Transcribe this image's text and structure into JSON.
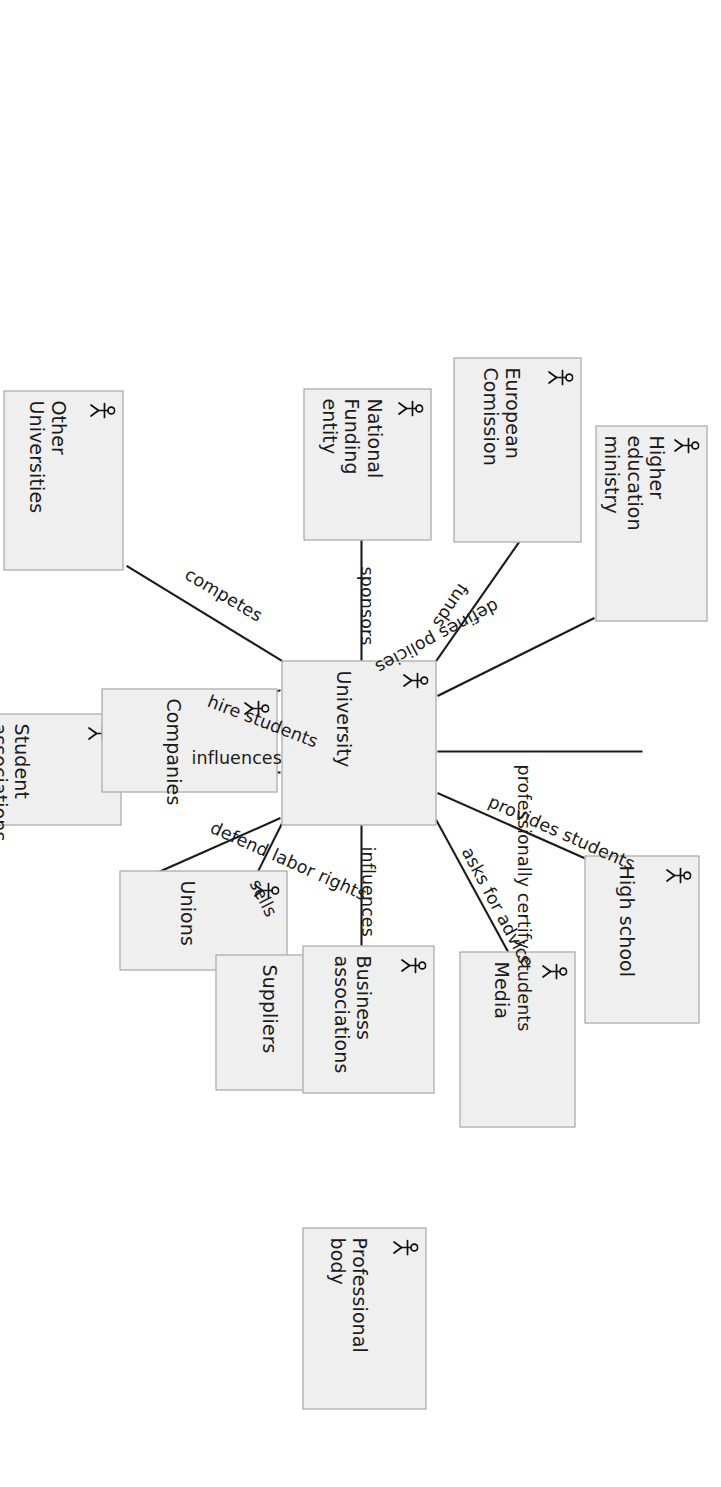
{
  "diagram": {
    "type": "actor-relationship-diagram",
    "orientation_deg": 90,
    "style": {
      "node_fill": "#efefef",
      "node_border": "#9a9a9a",
      "edge_color": "#1b1b1b",
      "text_color": "#1b1b1b",
      "background": "#ffffff"
    },
    "center_node": "University",
    "icon": "actor-stick-figure-icon",
    "nodes": [
      {
        "id": "university",
        "label": "University"
      },
      {
        "id": "student_associations",
        "label": "Student\nassociations"
      },
      {
        "id": "companies",
        "label": "Companies"
      },
      {
        "id": "unions",
        "label": "Unions"
      },
      {
        "id": "other_universities",
        "label": "Other\nUniversities"
      },
      {
        "id": "suppliers",
        "label": "Suppliers"
      },
      {
        "id": "national_funding",
        "label": "National\nFunding entity"
      },
      {
        "id": "business_assoc",
        "label": "Business\nassociations"
      },
      {
        "id": "european_commission",
        "label": "European\nComission"
      },
      {
        "id": "media",
        "label": "Media"
      },
      {
        "id": "higher_ed_ministry",
        "label": "Higher\neducation\nministry"
      },
      {
        "id": "high_school",
        "label": "High school"
      },
      {
        "id": "professional_body",
        "label": "Professional\nbody"
      }
    ],
    "edges": [
      {
        "id": "e_competes",
        "from": "other_universities",
        "to": "university",
        "label": "competes"
      },
      {
        "id": "e_hire",
        "from": "companies",
        "to": "university",
        "label": "hire students"
      },
      {
        "id": "e_influences1",
        "from": "student_associations",
        "to": "university",
        "label": "influences"
      },
      {
        "id": "e_defend",
        "from": "unions",
        "to": "university",
        "label": "defend labor rights"
      },
      {
        "id": "e_sells",
        "from": "suppliers",
        "to": "university",
        "label": "sells"
      },
      {
        "id": "e_sponsors",
        "from": "national_funding",
        "to": "university",
        "label": "sponsors"
      },
      {
        "id": "e_influences2",
        "from": "business_assoc",
        "to": "university",
        "label": "influences"
      },
      {
        "id": "e_funds",
        "from": "european_commission",
        "to": "university",
        "label": "funds"
      },
      {
        "id": "e_policies",
        "from": "higher_ed_ministry",
        "to": "university",
        "label": "defines policies"
      },
      {
        "id": "e_certify",
        "from": "professional_body",
        "to": "university",
        "label": "professionally certify students"
      },
      {
        "id": "e_provides",
        "from": "high_school",
        "to": "university",
        "label": "provides students"
      },
      {
        "id": "e_advice",
        "from": "media",
        "to": "university",
        "label": "asks for advice"
      }
    ]
  }
}
